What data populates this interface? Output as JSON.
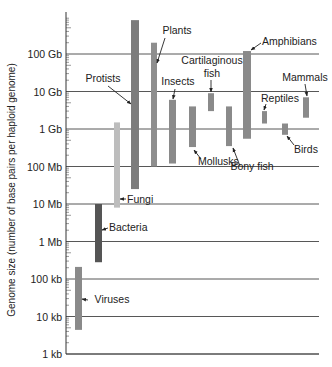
{
  "chart_data": {
    "type": "bar",
    "subtype": "floating-range-bar (log scale)",
    "title": "",
    "xlabel": "",
    "ylabel": "Genome size (number of base pairs per haploid genome)",
    "yscale": "log10",
    "ylim": [
      1000,
      1000000000000
    ],
    "grid": true,
    "legend": "none (direct labels with arrows)",
    "yticks": [
      {
        "label": "1 kb",
        "value": 1000
      },
      {
        "label": "10 kb",
        "value": 10000
      },
      {
        "label": "100 kb",
        "value": 100000
      },
      {
        "label": "1 Mb",
        "value": 1000000
      },
      {
        "label": "10 Mb",
        "value": 10000000
      },
      {
        "label": "100 Mb",
        "value": 100000000
      },
      {
        "label": "1 Gb",
        "value": 1000000000
      },
      {
        "label": "10 Gb",
        "value": 10000000000
      },
      {
        "label": "100 Gb",
        "value": 100000000000
      }
    ],
    "categories": [
      "Viruses",
      "Bacteria",
      "Fungi",
      "Protists",
      "Plants",
      "Insects",
      "Mollusks",
      "Cartilaginous fish",
      "Bony fish",
      "Amphibians",
      "Reptiles",
      "Birds",
      "Mammals"
    ],
    "series": [
      {
        "name": "Viruses",
        "min": 4400,
        "max": 210000,
        "color": "#8a8a8a"
      },
      {
        "name": "Bacteria",
        "min": 280000,
        "max": 10000000,
        "color": "#555555"
      },
      {
        "name": "Fungi",
        "min": 8000000,
        "max": 1500000000,
        "color": "#bdbdbd"
      },
      {
        "name": "Protists",
        "min": 25000000,
        "max": 800000000000,
        "color": "#7c7c7c"
      },
      {
        "name": "Plants",
        "min": 100000000,
        "max": 200000000000,
        "color": "#8e8e8e"
      },
      {
        "name": "Insects",
        "min": 120000000,
        "max": 6000000000,
        "color": "#8a8a8a"
      },
      {
        "name": "Mollusks",
        "min": 330000000,
        "max": 4000000000,
        "color": "#8a8a8a"
      },
      {
        "name": "Cartilaginous fish",
        "min": 3000000000,
        "max": 9000000000,
        "color": "#8a8a8a"
      },
      {
        "name": "Bony fish",
        "min": 350000000,
        "max": 4000000000,
        "color": "#8a8a8a"
      },
      {
        "name": "Amphibians",
        "min": 550000000,
        "max": 120000000000,
        "color": "#8a8a8a"
      },
      {
        "name": "Reptiles",
        "min": 1400000000,
        "max": 3000000000,
        "color": "#8a8a8a"
      },
      {
        "name": "Birds",
        "min": 700000000,
        "max": 1400000000,
        "color": "#8a8a8a"
      },
      {
        "name": "Mammals",
        "min": 2000000000,
        "max": 7000000000,
        "color": "#8a8a8a"
      }
    ]
  },
  "layout": {
    "axis_x": 66,
    "grid_right": 319,
    "y_1kb": 354,
    "px_per_decade": 37.5,
    "bars": [
      {
        "x": 75,
        "w": 7
      },
      {
        "x": 95,
        "w": 7
      },
      {
        "x": 114,
        "w": 6
      },
      {
        "x": 131,
        "w": 8
      },
      {
        "x": 151,
        "w": 6
      },
      {
        "x": 169,
        "w": 7
      },
      {
        "x": 189,
        "w": 7
      },
      {
        "x": 208,
        "w": 6
      },
      {
        "x": 226,
        "w": 6
      },
      {
        "x": 243,
        "w": 8
      },
      {
        "x": 262,
        "w": 5
      },
      {
        "x": 282,
        "w": 6
      },
      {
        "x": 303,
        "w": 6
      }
    ],
    "labels": [
      {
        "text": "Viruses",
        "x": 112,
        "y": 303,
        "anchor": "middle",
        "arrow": [
          [
            88,
            300
          ],
          [
            82,
            299
          ],
          [
            97,
            296
          ]
        ]
      },
      {
        "text": "Bacteria",
        "x": 109,
        "y": 231,
        "anchor": "start",
        "arrow": [
          [
            108,
            228
          ],
          [
            102,
            230
          ]
        ]
      },
      {
        "text": "Fungi",
        "x": 127,
        "y": 203,
        "anchor": "start",
        "arrow": [
          [
            126,
            199
          ],
          [
            120,
            199
          ]
        ]
      },
      {
        "text": "Protists",
        "x": 103,
        "y": 82,
        "anchor": "middle",
        "arrow": [
          [
            108,
            86
          ],
          [
            131,
            104
          ]
        ]
      },
      {
        "text": "Plants",
        "x": 177,
        "y": 34,
        "anchor": "middle",
        "arrow": [
          [
            165,
            38
          ],
          [
            157,
            63
          ]
        ]
      },
      {
        "text": "Insects",
        "x": 178,
        "y": 85,
        "anchor": "middle",
        "arrow": [
          [
            175,
            89
          ],
          [
            173,
            99
          ]
        ]
      },
      {
        "text": "Mollusks",
        "x": 198,
        "y": 165,
        "anchor": "start",
        "arrow": [
          [
            201,
            159
          ],
          [
            194,
            150
          ]
        ]
      },
      {
        "text": "Cartilaginous",
        "x": 212,
        "y": 64,
        "anchor": "middle",
        "arrow": null
      },
      {
        "text": "fish",
        "x": 212,
        "y": 77,
        "anchor": "middle",
        "arrow": [
          [
            211,
            80
          ],
          [
            211,
            92
          ]
        ]
      },
      {
        "text": "Bony fish",
        "x": 252,
        "y": 170,
        "anchor": "middle",
        "arrow": [
          [
            240,
            166
          ],
          [
            233,
            148
          ]
        ]
      },
      {
        "text": "Amphibians",
        "x": 262,
        "y": 45,
        "anchor": "start",
        "arrow": [
          [
            261,
            43
          ],
          [
            251,
            50
          ]
        ]
      },
      {
        "text": "Reptiles",
        "x": 261,
        "y": 102,
        "anchor": "start",
        "arrow": [
          [
            266,
            104
          ],
          [
            264,
            110
          ]
        ]
      },
      {
        "text": "Birds",
        "x": 294,
        "y": 153,
        "anchor": "start",
        "arrow": [
          [
            294,
            145
          ],
          [
            287,
            136
          ]
        ]
      },
      {
        "text": "Mammals",
        "x": 305,
        "y": 81,
        "anchor": "middle",
        "arrow": [
          [
            305,
            84
          ],
          [
            307,
            96
          ]
        ]
      }
    ]
  }
}
